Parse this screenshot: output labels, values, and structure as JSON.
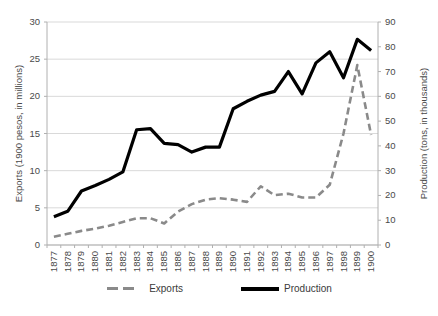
{
  "chart_data": {
    "type": "line",
    "title": "",
    "xlabel": "",
    "categories": [
      "1877",
      "1878",
      "1879",
      "1880",
      "1881",
      "1882",
      "1883",
      "1884",
      "1885",
      "1886",
      "1887",
      "1888",
      "1889",
      "1890",
      "1891",
      "1892",
      "1893",
      "1894",
      "1895",
      "1896",
      "1897",
      "1898",
      "1899",
      "1900"
    ],
    "series": [
      {
        "name": "Exports",
        "axis": "left",
        "unit": "1900 pesos, in millions",
        "color": "#8a8a8a",
        "style": "dashed",
        "values": [
          1.1,
          1.5,
          1.9,
          2.2,
          2.6,
          3.1,
          3.6,
          3.6,
          2.9,
          4.5,
          5.5,
          6.1,
          6.3,
          6.1,
          5.8,
          7.9,
          6.7,
          6.9,
          6.4,
          6.4,
          8.1,
          15.0,
          24.2,
          14.8
        ]
      },
      {
        "name": "Production",
        "axis": "right",
        "unit": "tons, in thousands",
        "color": "#000000",
        "style": "solid",
        "values": [
          11.4,
          13.6,
          21.8,
          24.0,
          26.5,
          29.5,
          46.5,
          47.0,
          41.0,
          40.5,
          37.5,
          39.5,
          39.5,
          55.0,
          58.0,
          60.5,
          62.0,
          70.0,
          61.0,
          73.5,
          78.0,
          67.5,
          83.0,
          78.5
        ]
      }
    ],
    "left_axis": {
      "label": "Exports (1900 pesos, in millions)",
      "ticks": [
        0,
        5,
        10,
        15,
        20,
        25,
        30
      ],
      "min": 0,
      "max": 30
    },
    "right_axis": {
      "label": "Production (tons, in thousands)",
      "ticks": [
        0,
        10,
        20,
        30,
        40,
        50,
        60,
        70,
        80,
        90
      ],
      "min": 0,
      "max": 90
    },
    "grid": true,
    "legend_position": "bottom",
    "legend": [
      "Exports",
      "Production"
    ]
  },
  "legend": {
    "exports_label": "Exports",
    "production_label": "Production"
  },
  "axis_titles": {
    "left": "Exports (1900 pesos, in millions)",
    "right": "Production (tons, in thousands)"
  }
}
